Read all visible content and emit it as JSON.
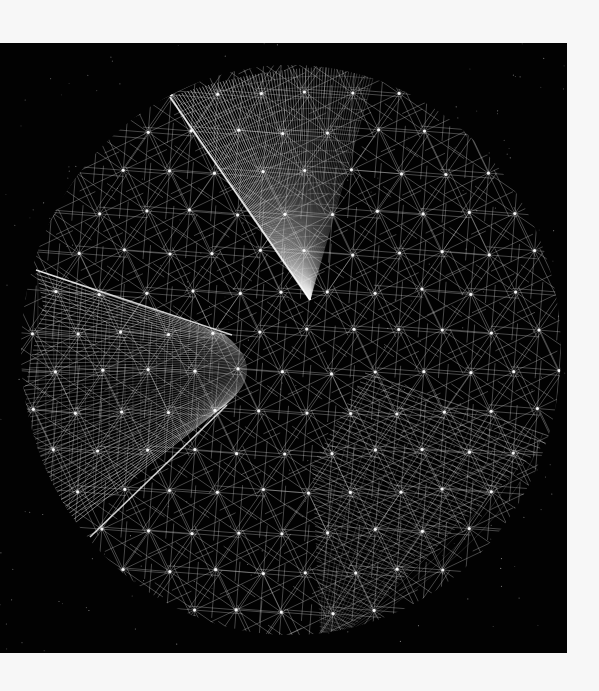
{
  "artwork": {
    "background_color": "#f7f7f7",
    "frame_color": "#020202",
    "line_color": "#d9d9d9",
    "node_color": "#ffffff",
    "frame": {
      "x": 0,
      "y": 43,
      "width": 567,
      "height": 610
    },
    "circle": {
      "cx": 291,
      "cy": 307,
      "rx": 270,
      "ry": 285
    },
    "lattice": {
      "spacing": 46,
      "node_radius": 1.6,
      "line_opacity": 0.55
    },
    "fans": [
      {
        "name": "top-fan",
        "apex": [
          310,
          257
        ],
        "left": [
          170,
          54
        ],
        "right": [
          376,
          25
        ],
        "lines": 70,
        "brightness": 0.85
      },
      {
        "name": "left-fan",
        "apex": [
          247,
          327
        ],
        "top": [
          36,
          227
        ],
        "bottom": [
          90,
          494
        ],
        "lines": 60,
        "brightness": 0.8
      },
      {
        "name": "bottom-right-fan",
        "corner": [
          312,
          422
        ],
        "top": [
          365,
          330
        ],
        "right": [
          552,
          394
        ],
        "bottom": [
          320,
          592
        ],
        "lines": 60,
        "brightness": 0.75
      }
    ]
  }
}
